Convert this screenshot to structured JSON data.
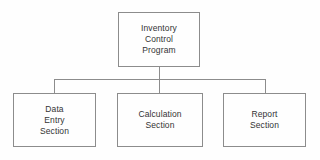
{
  "diagram": {
    "type": "hierarchy-chart",
    "colors": {
      "background": "#fefefe",
      "box_border": "#8c8c8c",
      "connector": "#8c8c8c",
      "text": "#333333"
    },
    "root": {
      "id": "inventory-control-program",
      "lines": [
        "Inventory",
        "Control",
        "Program"
      ]
    },
    "children": [
      {
        "id": "data-entry-section",
        "lines": [
          "Data",
          "Entry",
          "Section"
        ]
      },
      {
        "id": "calculation-section",
        "lines": [
          "Calculation",
          "Section"
        ]
      },
      {
        "id": "report-section",
        "lines": [
          "Report",
          "Section"
        ]
      }
    ]
  }
}
